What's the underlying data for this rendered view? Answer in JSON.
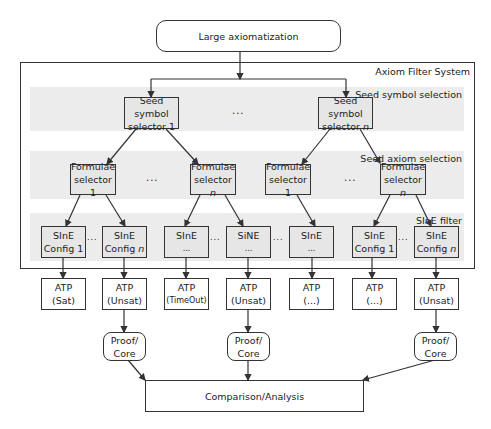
{
  "title_box": {
    "label": "Large axiomatization"
  },
  "system": {
    "label": "Axiom Filter System",
    "bands": [
      {
        "label": "Seed symbol selection"
      },
      {
        "label": "Seed axiom selection"
      },
      {
        "label": "SInE filter"
      }
    ]
  },
  "seed_selectors": [
    {
      "line1": "Seed symbol",
      "line2": "selector 1"
    },
    {
      "line1": "Seed symbol",
      "line2": "selector",
      "suffix": "n"
    }
  ],
  "formulae_selectors": [
    {
      "line1": "Formulae",
      "line2": "selector 1",
      "suffix": ""
    },
    {
      "line1": "Formulae",
      "line2": "selector",
      "suffix": "n"
    },
    {
      "line1": "Formulae",
      "line2": "selector 1",
      "suffix": ""
    },
    {
      "line1": "Formulae",
      "line2": "selector",
      "suffix": "n"
    }
  ],
  "sine_configs": [
    {
      "line1": "SInE",
      "line2": "Config 1",
      "suffix": ""
    },
    {
      "line1": "SInE",
      "line2": "Config",
      "suffix": "n"
    },
    {
      "line1": "SInE",
      "line2": "...",
      "suffix": ""
    },
    {
      "line1": "SiNE",
      "line2": "...",
      "suffix": ""
    },
    {
      "line1": "SInE",
      "line2": "...",
      "suffix": ""
    },
    {
      "line1": "SInE",
      "line2": "Config 1",
      "suffix": ""
    },
    {
      "line1": "SInE",
      "line2": "Config",
      "suffix": "n"
    }
  ],
  "atp_results": [
    {
      "line1": "ATP",
      "line2": "(Sat)"
    },
    {
      "line1": "ATP",
      "line2": "(Unsat)"
    },
    {
      "line1": "ATP",
      "line2": "(TimeOut)"
    },
    {
      "line1": "ATP",
      "line2": "(Unsat)"
    },
    {
      "line1": "ATP",
      "line2": "(...)"
    },
    {
      "line1": "ATP",
      "line2": "(...)"
    },
    {
      "line1": "ATP",
      "line2": "(Unsat)"
    }
  ],
  "proof_core": [
    {
      "line1": "Proof/",
      "line2": "Core"
    },
    {
      "line1": "Proof/",
      "line2": "Core"
    },
    {
      "line1": "Proof/",
      "line2": "Core"
    }
  ],
  "analysis_box": {
    "label": "Comparison/Analysis"
  },
  "ellipsis": "...",
  "colors": {
    "line": "#333333",
    "band": "#ececec",
    "node_fill": "#e6e6e6"
  }
}
